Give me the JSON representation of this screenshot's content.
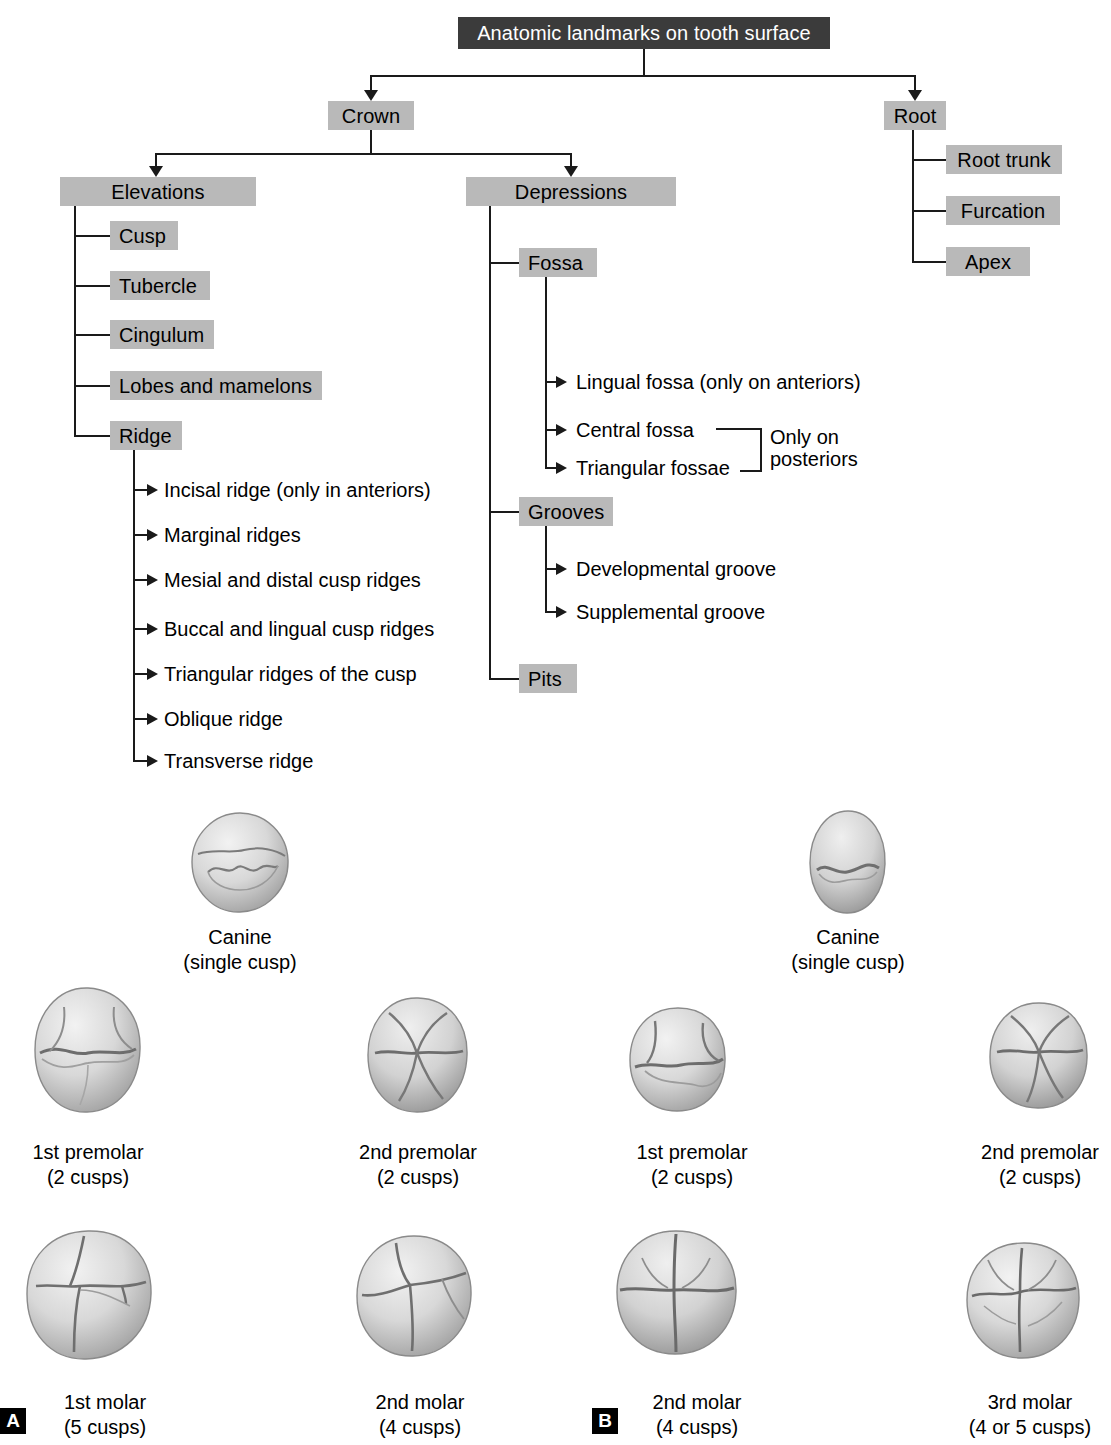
{
  "diagram": {
    "root_box": {
      "label": "Anatomic landmarks on tooth surface"
    },
    "level1": [
      {
        "label": "Crown"
      },
      {
        "label": "Root"
      }
    ],
    "crown_children": [
      {
        "label": "Elevations"
      },
      {
        "label": "Depressions"
      }
    ],
    "root_children": [
      {
        "label": "Root trunk"
      },
      {
        "label": "Furcation"
      },
      {
        "label": "Apex"
      }
    ],
    "elevations_children": [
      {
        "label": "Cusp"
      },
      {
        "label": "Tubercle"
      },
      {
        "label": "Cingulum"
      },
      {
        "label": "Lobes and mamelons"
      },
      {
        "label": "Ridge"
      }
    ],
    "ridge_children": [
      {
        "label": "Incisal ridge (only in anteriors)"
      },
      {
        "label": "Marginal ridges"
      },
      {
        "label": "Mesial and distal cusp ridges"
      },
      {
        "label": "Buccal and lingual cusp ridges"
      },
      {
        "label": "Triangular ridges of the cusp"
      },
      {
        "label": "Oblique ridge"
      },
      {
        "label": "Transverse ridge"
      }
    ],
    "depressions_children": [
      {
        "label": "Fossa"
      },
      {
        "label": "Grooves"
      },
      {
        "label": "Pits"
      }
    ],
    "fossa_children": [
      {
        "label": "Lingual fossa (only on anteriors)"
      },
      {
        "label": "Central fossa"
      },
      {
        "label": "Triangular fossae"
      }
    ],
    "fossa_bracket_note": "Only on\nposteriors",
    "grooves_children": [
      {
        "label": "Developmental groove"
      },
      {
        "label": "Supplemental groove"
      }
    ]
  },
  "figures": {
    "panel_a": "A",
    "panel_b": "B",
    "teeth": [
      {
        "name": "Canine",
        "detail": "(single cusp)"
      },
      {
        "name": "Canine",
        "detail": "(single cusp)"
      },
      {
        "name": "1st premolar",
        "detail": "(2 cusps)"
      },
      {
        "name": "2nd premolar",
        "detail": "(2 cusps)"
      },
      {
        "name": "1st premolar",
        "detail": "(2 cusps)"
      },
      {
        "name": "2nd premolar",
        "detail": "(2 cusps)"
      },
      {
        "name": "1st molar",
        "detail": "(5 cusps)"
      },
      {
        "name": "2nd molar",
        "detail": "(4 cusps)"
      },
      {
        "name": "2nd molar",
        "detail": "(4 cusps)"
      },
      {
        "name": "3rd molar",
        "detail": "(4 or 5 cusps)"
      }
    ]
  },
  "colors": {
    "box_fill": "#b9b9b9",
    "header_fill": "#3b3b3b",
    "header_text": "#ffffff",
    "line": "#1a1a1a",
    "tooth_light": "#e9e9e9",
    "tooth_mid": "#c2c2c2",
    "tooth_dark": "#8f8f8f"
  }
}
